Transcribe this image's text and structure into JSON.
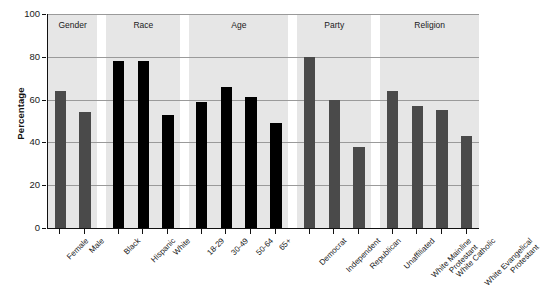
{
  "chart_data": {
    "type": "bar",
    "title": "",
    "xlabel": "",
    "ylabel": "Percentage",
    "ylim": [
      0,
      100
    ],
    "yticks": [
      0,
      20,
      40,
      60,
      80,
      100
    ],
    "grid": true,
    "legend": "none",
    "panels": [
      {
        "name": "Gender",
        "color": "#4a4a4a",
        "categories": [
          "Female",
          "Male"
        ],
        "values": [
          64,
          54
        ]
      },
      {
        "name": "Race",
        "color": "#000000",
        "categories": [
          "Black",
          "Hispanic",
          "White"
        ],
        "values": [
          78,
          78,
          53
        ]
      },
      {
        "name": "Age",
        "color": "#000000",
        "categories": [
          "18-29",
          "30-49",
          "50-64",
          "65+"
        ],
        "values": [
          59,
          66,
          61,
          49
        ]
      },
      {
        "name": "Party",
        "color": "#4a4a4a",
        "categories": [
          "Democrat",
          "Independent",
          "Republican"
        ],
        "values": [
          80,
          60,
          38
        ]
      },
      {
        "name": "Religion",
        "color": "#4a4a4a",
        "categories": [
          "Unaffiliated",
          "White Mainline\nProtestant",
          "White Catholic",
          "White Evangelical\nProtestant"
        ],
        "values": [
          64,
          57,
          55,
          43
        ]
      }
    ]
  },
  "axis": {
    "y_title": "Percentage"
  }
}
